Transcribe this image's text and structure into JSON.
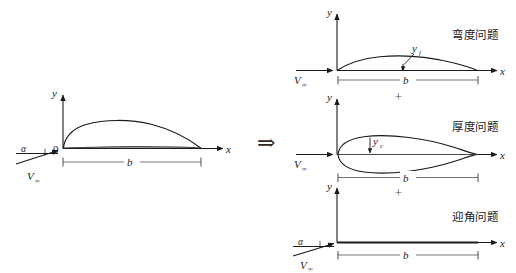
{
  "figure": {
    "background_color": "#ffffff",
    "line_color": "#1a1a1a"
  },
  "decomposition_operator": {
    "symbol": "⇒",
    "name": "implies-arrow"
  },
  "sum_operators": [
    {
      "symbol": "+"
    },
    {
      "symbol": "+"
    }
  ],
  "labels": {
    "y_axis": "y",
    "x_axis": "x",
    "origin": "0",
    "chord": "b",
    "freestream": "V",
    "freestream_sub": "∞",
    "alpha": "α",
    "camber_ordinate": "y",
    "camber_ordinate_sub": "f",
    "thickness_ordinate": "y",
    "thickness_ordinate_sub": "c"
  },
  "panels": {
    "original": {
      "name": "original-airfoil",
      "caption": "",
      "y_axis": "y",
      "x_axis": "x",
      "origin": "0",
      "chord_label": "b",
      "freestream_label": "V",
      "freestream_sub": "∞",
      "alpha_label": "α"
    },
    "camber": {
      "name": "camber-problem",
      "caption": "弯度问题",
      "y_axis": "y",
      "x_axis": "x",
      "chord_label": "b",
      "freestream_label": "V",
      "freestream_sub": "∞",
      "ordinate_label": "y",
      "ordinate_sub": "f"
    },
    "thickness": {
      "name": "thickness-problem",
      "caption": "厚度问题",
      "y_axis": "y",
      "x_axis": "x",
      "chord_label": "b",
      "freestream_label": "V",
      "freestream_sub": "∞",
      "ordinate_label": "y",
      "ordinate_sub": "c"
    },
    "angle_of_attack": {
      "name": "angle-of-attack-problem",
      "caption": "迎角问题",
      "y_axis": "y",
      "x_axis": "x",
      "chord_label": "b",
      "freestream_label": "V",
      "freestream_sub": "∞",
      "alpha_label": "α"
    }
  }
}
